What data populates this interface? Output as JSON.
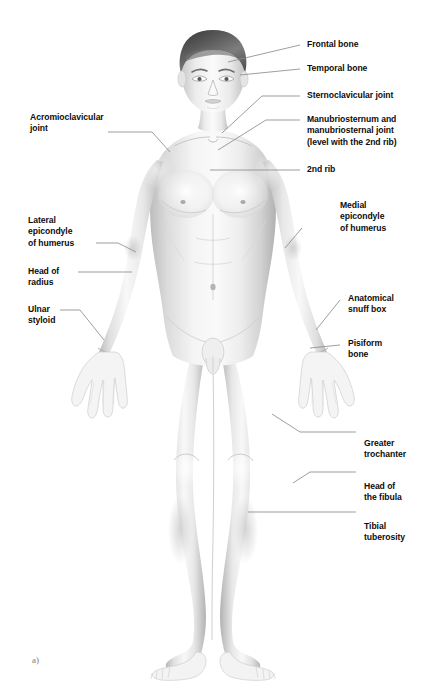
{
  "figure": {
    "caption": "a)",
    "palette": {
      "background": "#ffffff",
      "skin_light": "#f2f2f2",
      "skin_mid": "#dcdcdc",
      "skin_shadow": "#b9b9b9",
      "skin_deep": "#9a9a9a",
      "hair_dark": "#4a4a4a",
      "hair_light": "#8e8e8e",
      "leader_line": "#8c8c8c",
      "label_text": "#0d0d0d",
      "caption_text": "#7a7a7a"
    }
  },
  "labels_right": [
    {
      "id": "frontal-bone",
      "text": "Frontal bone"
    },
    {
      "id": "temporal-bone",
      "text": "Temporal bone"
    },
    {
      "id": "sternoclavicular-joint",
      "text": "Sternoclavicular joint"
    },
    {
      "id": "manubriosternum",
      "text": "Manubriosternum and\nmanubriosternal joint\n(level with the 2nd rib)"
    },
    {
      "id": "second-rib",
      "text": "2nd rib"
    },
    {
      "id": "medial-epicondyle",
      "text": "Medial\nepicondyle\nof humerus"
    },
    {
      "id": "anatomical-snuff-box",
      "text": "Anatomical\nsnuff box"
    },
    {
      "id": "pisiform-bone",
      "text": "Pisiform\nbone"
    },
    {
      "id": "greater-trochanter",
      "text": "Greater\ntrochanter"
    },
    {
      "id": "head-of-fibula",
      "text": "Head of\nthe fibula"
    },
    {
      "id": "tibial-tuberosity",
      "text": "Tibial\ntuberosity"
    }
  ],
  "labels_left": [
    {
      "id": "acromioclavicular-joint",
      "text": "Acromioclavicular\njoint"
    },
    {
      "id": "lateral-epicondyle",
      "text": "Lateral\nepicondyle\nof humerus"
    },
    {
      "id": "head-of-radius",
      "text": "Head of\nradius"
    },
    {
      "id": "ulnar-styloid",
      "text": "Ulnar\nstyloid"
    }
  ]
}
